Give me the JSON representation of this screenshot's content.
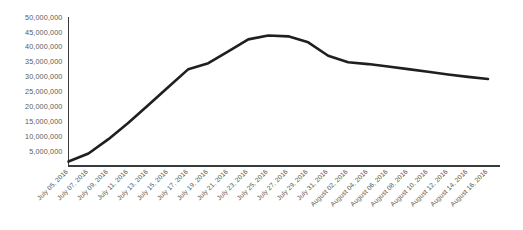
{
  "chart_data": {
    "type": "line",
    "title": "",
    "subtitle": "",
    "xlabel": "",
    "ylabel": "",
    "grid": false,
    "legend": false,
    "ylim": [
      0,
      50000000
    ],
    "y_tick_values": [
      5000000,
      10000000,
      15000000,
      20000000,
      25000000,
      30000000,
      35000000,
      40000000,
      45000000,
      50000000
    ],
    "y_tick_labels": [
      "5,000,000",
      "10,000,000",
      "15,000,000",
      "20,000,000",
      "25,000,000",
      "30,000,000",
      "35,000,000",
      "40,000,000",
      "45,000,000",
      "50,000,000"
    ],
    "categories": [
      "July 05, 2016",
      "July 07, 2016",
      "July 09, 2016",
      "July 11, 2016",
      "July 13, 2016",
      "July 15, 2016",
      "July 17, 2016",
      "July 19, 2016",
      "July 21, 2016",
      "July 23, 2016",
      "July 25, 2016",
      "July 27, 2016",
      "July 29, 2016",
      "July 31, 2016",
      "August 02, 2016",
      "August 04, 2016",
      "August 06, 2016",
      "August 08, 2016",
      "August 10, 2016",
      "August 12, 2016",
      "August 14, 2016",
      "August 16, 2016"
    ],
    "values": [
      1500000,
      4200000,
      9000000,
      14500000,
      20500000,
      26500000,
      32500000,
      34500000,
      38500000,
      42500000,
      43800000,
      43500000,
      41500000,
      37000000,
      34800000,
      34200000,
      33400000,
      32500000,
      31600000,
      30700000,
      29900000,
      29200000
    ],
    "series_name": "",
    "line_color": "#1f1f1f",
    "axis_color": "#3a3a3a",
    "background_color": "#ffffff"
  }
}
